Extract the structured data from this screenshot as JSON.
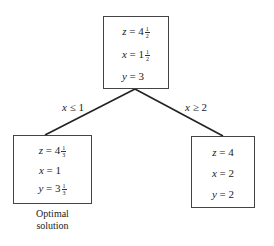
{
  "nodes": {
    "root": {
      "z": {
        "var": "z",
        "whole": "4",
        "num": "1",
        "den": "2"
      },
      "x": {
        "var": "x",
        "whole": "1",
        "num": "1",
        "den": "2"
      },
      "y": {
        "var": "y",
        "whole": "3"
      }
    },
    "left": {
      "z": {
        "var": "z",
        "whole": "4",
        "num": "1",
        "den": "3"
      },
      "x": {
        "var": "x",
        "whole": "1"
      },
      "y": {
        "var": "y",
        "whole": "3",
        "num": "1",
        "den": "3"
      },
      "caption_line1": "Optimal",
      "caption_line2": "solution"
    },
    "right": {
      "z": {
        "var": "z",
        "whole": "4"
      },
      "x": {
        "var": "x",
        "whole": "2"
      },
      "y": {
        "var": "y",
        "whole": "2"
      }
    }
  },
  "edges": {
    "left": {
      "var": "x",
      "op": "≤",
      "value": "1"
    },
    "right": {
      "var": "x",
      "op": "≥",
      "value": "2"
    }
  },
  "eq": "="
}
